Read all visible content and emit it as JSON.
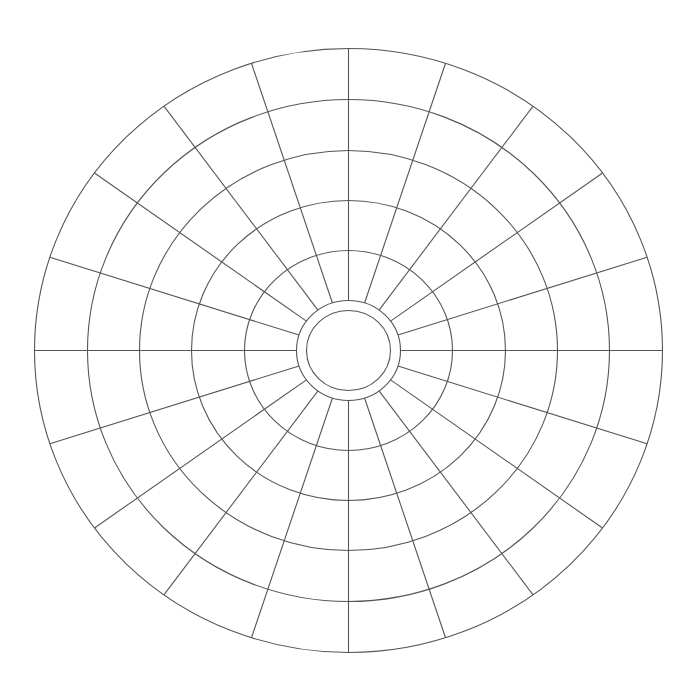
{
  "diagram": {
    "type": "polar-grid",
    "canvas": {
      "width": 697,
      "height": 696,
      "background": "#ffffff"
    },
    "center": {
      "x": 348.5,
      "y": 350.5
    },
    "line_color": "#555555",
    "rings": [
      {
        "name": "ring-outer",
        "rx": 314,
        "ry": 302
      },
      {
        "name": "ring-5",
        "rx": 261,
        "ry": 251
      },
      {
        "name": "ring-4",
        "rx": 209,
        "ry": 200
      },
      {
        "name": "ring-3",
        "rx": 157,
        "ry": 150
      },
      {
        "name": "ring-2",
        "rx": 104,
        "ry": 100
      },
      {
        "name": "ring-1",
        "rx": 52,
        "ry": 50
      },
      {
        "name": "ring-core",
        "rx": 42,
        "ry": 40
      }
    ],
    "spokes": {
      "count": 20,
      "angle_step_deg": 18,
      "start_angle_deg": 0,
      "inner_ring_index": 5,
      "outer_ring_index": 0
    }
  }
}
